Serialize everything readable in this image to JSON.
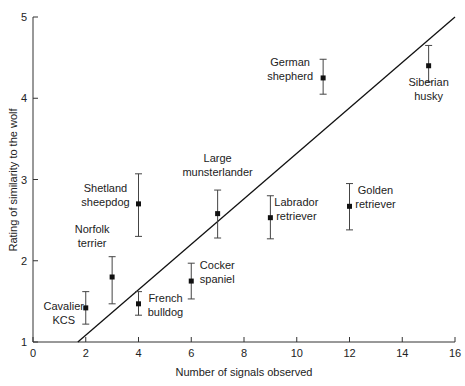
{
  "chart_data": {
    "type": "scatter",
    "title": "",
    "xlabel": "Number of signals observed",
    "ylabel": "Rating of similarity to the wolf",
    "xlim": [
      0,
      16
    ],
    "ylim": [
      1,
      5
    ],
    "xticks": [
      0,
      2,
      4,
      6,
      8,
      10,
      12,
      14,
      16
    ],
    "yticks": [
      1,
      2,
      3,
      4,
      5
    ],
    "grid": false,
    "legend": null,
    "points": [
      {
        "label": [
          "Cavalier",
          "KCS"
        ],
        "x": 2,
        "y": 1.42,
        "err_low": 1.22,
        "err_high": 1.62,
        "label_pos": "left-below"
      },
      {
        "label": [
          "Norfolk",
          "terrier"
        ],
        "x": 3,
        "y": 1.8,
        "err_low": 1.47,
        "err_high": 2.05,
        "label_pos": "left-above"
      },
      {
        "label": [
          "French",
          "bulldog"
        ],
        "x": 4,
        "y": 1.47,
        "err_low": 1.33,
        "err_high": 1.62,
        "label_pos": "right-below"
      },
      {
        "label": [
          "Shetland",
          "sheepdog"
        ],
        "x": 4,
        "y": 2.7,
        "err_low": 2.3,
        "err_high": 3.07,
        "label_pos": "left"
      },
      {
        "label": [
          "Cocker",
          "spaniel"
        ],
        "x": 6,
        "y": 1.75,
        "err_low": 1.53,
        "err_high": 1.97,
        "label_pos": "right"
      },
      {
        "label": [
          "Large",
          "munsterlander"
        ],
        "x": 7,
        "y": 2.58,
        "err_low": 2.28,
        "err_high": 2.87,
        "label_pos": "above"
      },
      {
        "label": [
          "Labrador",
          "retriever"
        ],
        "x": 9,
        "y": 2.53,
        "err_low": 2.27,
        "err_high": 2.8,
        "label_pos": "right"
      },
      {
        "label": [
          "Golden",
          "retriever"
        ],
        "x": 12,
        "y": 2.67,
        "err_low": 2.38,
        "err_high": 2.95,
        "label_pos": "right"
      },
      {
        "label": [
          "German",
          "shepherd"
        ],
        "x": 11,
        "y": 4.25,
        "err_low": 4.05,
        "err_high": 4.48,
        "label_pos": "left"
      },
      {
        "label": [
          "Siberian",
          "husky"
        ],
        "x": 15,
        "y": 4.4,
        "err_low": 4.2,
        "err_high": 4.65,
        "label_pos": "below"
      }
    ],
    "trendline": {
      "x1": 1.7,
      "y1": 1,
      "x2": 16,
      "y2": 5
    }
  }
}
